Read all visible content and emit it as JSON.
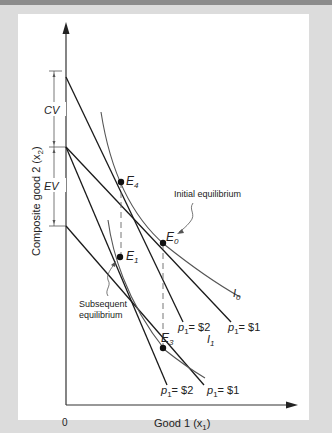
{
  "diagram": {
    "y_axis_label": "Composite good 2 (x",
    "y_axis_sub": "2",
    "x_axis_label": "Good 1 (x",
    "x_axis_sub": "1",
    "origin_label": "0",
    "brackets": {
      "cv": "CV",
      "ev": "EV"
    },
    "points": {
      "e4": {
        "letter": "E",
        "sub": "4"
      },
      "e0": {
        "letter": "E",
        "sub": "0"
      },
      "e1": {
        "letter": "E",
        "sub": "1"
      },
      "e3": {
        "letter": "E",
        "sub": "3"
      }
    },
    "curves": {
      "i0": {
        "letter": "I",
        "sub": "0"
      },
      "i1": {
        "letter": "I",
        "sub": "1"
      }
    },
    "annotations": {
      "initial": "Initial equilibrium",
      "subsequent_1": "Subsequent",
      "subsequent_2": "equilibrium"
    },
    "price_labels": {
      "upper_p2": {
        "p": "p",
        "sub": "1",
        "val": "= $2"
      },
      "upper_p1": {
        "p": "p",
        "sub": "1",
        "val": "= $1"
      },
      "lower_p2": {
        "p": "p",
        "sub": "1",
        "val": "= $2"
      },
      "lower_p1": {
        "p": "p",
        "sub": "1",
        "val": "= $1"
      }
    },
    "colors": {
      "background": "#dcdcdc",
      "panel": "#ffffff",
      "line": "#1a1a1a",
      "curve": "#555555"
    }
  }
}
